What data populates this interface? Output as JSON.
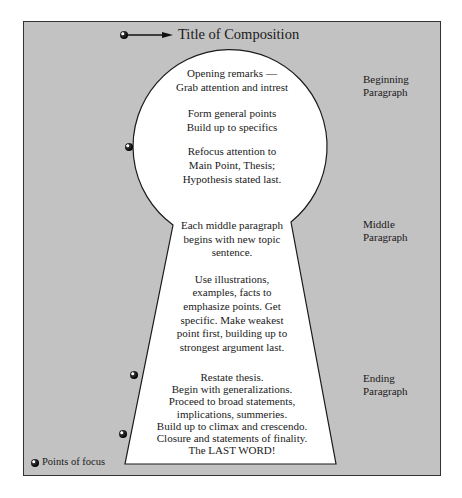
{
  "diagram": {
    "title": "Title of Composition",
    "fill_color": "#c2c2c2",
    "shape_color": "#ffffff",
    "keyhole": {
      "beginning": {
        "groups": [
          [
            "Opening remarks —",
            "Grab attention and intrest"
          ],
          [
            "Form general points",
            "Build up to specifics"
          ],
          [
            "Refocus attention to",
            "Main Point, Thesis;",
            "Hypothesis stated last."
          ]
        ]
      },
      "middle": {
        "groups": [
          [
            "Each middle paragraph",
            "begins with new topic",
            "sentence."
          ],
          [
            "Use illustrations,",
            "examples, facts to",
            "emphasize points. Get",
            "specific. Make weakest",
            "point first, building up to",
            "strongest argument last."
          ]
        ]
      },
      "ending": {
        "groups": [
          [
            "Restate thesis.",
            "Begin with generalizations.",
            "Proceed to broad statements,",
            "implications, summeries.",
            "Build up to climax and crescendo.",
            "Closure and statements of finality.",
            "The LAST WORD!"
          ]
        ]
      }
    },
    "side_labels": [
      {
        "line1": "Beginning",
        "line2": "Paragraph"
      },
      {
        "line1": "Middle",
        "line2": "Paragraph"
      },
      {
        "line1": "Ending",
        "line2": "Paragraph"
      }
    ],
    "legend": {
      "icon": "focus-point-icon",
      "label": "Points of focus"
    },
    "focus_points": [
      {
        "name": "title",
        "x": 124,
        "y": 35
      },
      {
        "name": "thesis",
        "x": 129,
        "y": 147
      },
      {
        "name": "ending-start",
        "x": 134,
        "y": 375
      },
      {
        "name": "last-word",
        "x": 123,
        "y": 434
      }
    ]
  }
}
